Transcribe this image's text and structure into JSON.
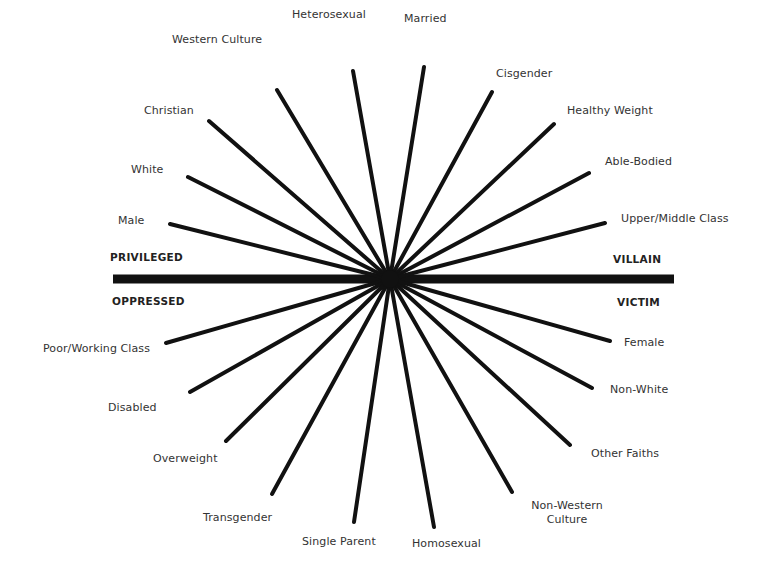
{
  "diagram": {
    "center": {
      "x": 390,
      "y": 279
    },
    "colors": {
      "line": "#111111",
      "axis": "#111111",
      "text": "#333333",
      "background": "#ffffff"
    },
    "axis": {
      "x1": 113,
      "x2": 674,
      "y": 279,
      "thickness": 9,
      "left_top": "PRIVILEGED",
      "left_bottom": "OPPRESSED",
      "right_top": "VILLAIN",
      "right_bottom": "VICTIM"
    },
    "privileged_spokes": [
      {
        "label": "Male",
        "x": 170,
        "y": 224
      },
      {
        "label": "White",
        "x": 188,
        "y": 177
      },
      {
        "label": "Christian",
        "x": 209,
        "y": 121
      },
      {
        "label": "Western Culture",
        "x": 277,
        "y": 90
      },
      {
        "label": "Heterosexual",
        "x": 353,
        "y": 71
      },
      {
        "label": "Married",
        "x": 424,
        "y": 67
      },
      {
        "label": "Cisgender",
        "x": 492,
        "y": 92
      },
      {
        "label": "Healthy Weight",
        "x": 554,
        "y": 124
      },
      {
        "label": "Able-Bodied",
        "x": 589,
        "y": 173
      },
      {
        "label": "Upper/Middle Class",
        "x": 605,
        "y": 223
      }
    ],
    "oppressed_spokes": [
      {
        "label": "Poor/Working Class",
        "x": 166,
        "y": 343
      },
      {
        "label": "Disabled",
        "x": 190,
        "y": 392
      },
      {
        "label": "Overweight",
        "x": 226,
        "y": 441
      },
      {
        "label": "Transgender",
        "x": 272,
        "y": 494
      },
      {
        "label": "Single Parent",
        "x": 354,
        "y": 522
      },
      {
        "label": "Homosexual",
        "x": 434,
        "y": 527
      },
      {
        "label": "Non-Western Culture",
        "x": 512,
        "y": 492
      },
      {
        "label": "Other Faiths",
        "x": 570,
        "y": 445
      },
      {
        "label": "Non-White",
        "x": 592,
        "y": 388
      },
      {
        "label": "Female",
        "x": 610,
        "y": 341
      }
    ],
    "labels": {
      "male": "Male",
      "white": "White",
      "christian": "Christian",
      "western_culture": "Western Culture",
      "heterosexual": "Heterosexual",
      "married": "Married",
      "cisgender": "Cisgender",
      "healthy_weight": "Healthy Weight",
      "able_bodied": "Able-Bodied",
      "upper_middle_class": "Upper/Middle Class",
      "poor_working_class": "Poor/Working Class",
      "disabled": "Disabled",
      "overweight": "Overweight",
      "transgender": "Transgender",
      "single_parent": "Single Parent",
      "homosexual": "Homosexual",
      "non_western_culture_line1": "Non-Western",
      "non_western_culture_line2": "Culture",
      "other_faiths": "Other Faiths",
      "non_white": "Non-White",
      "female": "Female"
    }
  }
}
